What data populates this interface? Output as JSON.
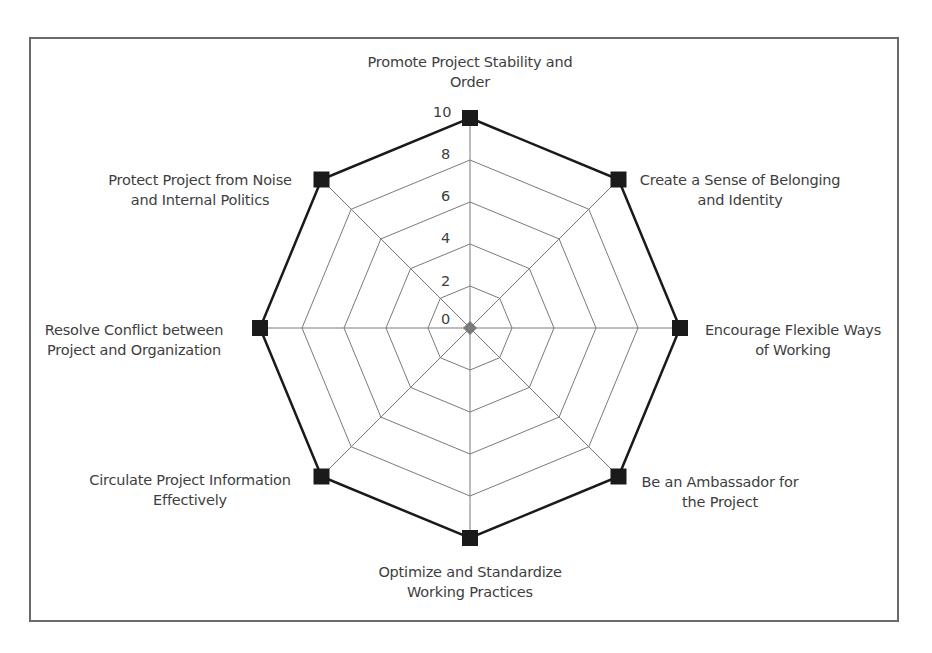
{
  "chart_data": {
    "type": "radar",
    "title": "",
    "categories": [
      "Promote Project Stability and Order",
      "Create a Sense of Belonging and Identity",
      "Encourage Flexible Ways of Working",
      "Be an Ambassador for the Project",
      "Optimize and Standardize Working Practices",
      "Circulate Project Information Effectively",
      "Resolve Conflict between Project and Organization",
      "Protect Project from Noise and Internal Politics"
    ],
    "series": [
      {
        "name": "Score",
        "values": [
          10,
          10,
          10,
          10,
          10,
          10,
          10,
          10
        ],
        "color": "#1a1a1a",
        "marker": "square"
      }
    ],
    "rlim": [
      0,
      10
    ],
    "r_ticks": [
      "0",
      "2",
      "4",
      "6",
      "8",
      "10"
    ],
    "grid": true,
    "legend": "none"
  },
  "labels": {
    "top": [
      "Promote Project Stability and",
      "Order"
    ],
    "top_right": [
      "Create a Sense of Belonging",
      "and Identity"
    ],
    "right": [
      "Encourage Flexible Ways",
      "of Working"
    ],
    "bottom_right": [
      "Be an Ambassador for",
      "the Project"
    ],
    "bottom": [
      "Optimize and Standardize",
      "Working Practices"
    ],
    "bottom_left": [
      "Circulate Project Information",
      "Effectively"
    ],
    "left": [
      "Resolve Conflict between",
      "Project and Organization"
    ],
    "top_left": [
      "Protect Project from Noise",
      "and Internal Politics"
    ]
  },
  "ticks": [
    "0",
    "2",
    "4",
    "6",
    "8",
    "10"
  ],
  "colors": {
    "grid": "#7a7a7a",
    "series": "#1a1a1a",
    "center": "#7a7a7a",
    "text": "#3e3e3e"
  }
}
